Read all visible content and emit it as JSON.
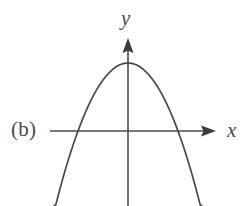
{
  "figure": {
    "part_label": "(b)",
    "x_axis_label": "x",
    "y_axis_label": "y",
    "stroke_color": "#4a4a4a",
    "background_color": "#ffffff"
  },
  "chart_data": {
    "type": "line",
    "title": "",
    "subtitle": "",
    "xlabel": "x",
    "ylabel": "y",
    "annotations": [
      "(b)"
    ],
    "grid": false,
    "legend": null,
    "curve": {
      "name": "parabola",
      "orientation": "opens-down",
      "vertex_px": [
        128,
        63
      ],
      "x_intercepts_px": [
        78,
        178
      ],
      "y_intercept_px": [
        128,
        63
      ],
      "endpoints_px": [
        [
          54,
          206
        ],
        [
          202,
          206
        ]
      ],
      "equation_form": "y = a(x - h)^2 + k, a < 0"
    },
    "axes": {
      "x_axis_y_px": 131,
      "x_axis_start_px": 50,
      "x_axis_arrow_tip_px": 216,
      "y_axis_x_px": 128,
      "y_axis_arrow_tip_px": 38,
      "y_axis_end_px": 206,
      "ticks": [],
      "tick_labels": []
    }
  }
}
